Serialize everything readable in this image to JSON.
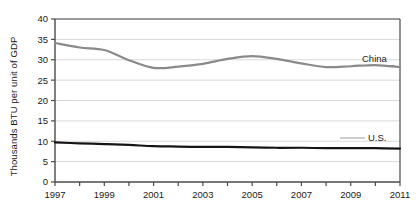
{
  "chart_data": {
    "type": "line",
    "title": "",
    "xlabel": "",
    "ylabel": "Thousands BTU per unit of GDP",
    "xlim": [
      1997,
      2011
    ],
    "ylim": [
      0,
      40
    ],
    "grid": true,
    "legend_position": "inline-right",
    "x": [
      1997,
      1998,
      1999,
      2000,
      2001,
      2002,
      2003,
      2004,
      2005,
      2006,
      2007,
      2008,
      2009,
      2010,
      2011
    ],
    "y_ticks": [
      0,
      5,
      10,
      15,
      20,
      25,
      30,
      35,
      40
    ],
    "y_tick_labels": [
      "0",
      "5",
      "10",
      "15",
      "20",
      "25",
      "30",
      "35",
      "40"
    ],
    "x_ticks": [
      1997,
      1998,
      1999,
      2000,
      2001,
      2002,
      2003,
      2004,
      2005,
      2006,
      2007,
      2008,
      2009,
      2010,
      2011
    ],
    "x_tick_labels": [
      "1997",
      "",
      "1999",
      "",
      "2001",
      "",
      "2003",
      "",
      "2005",
      "",
      "2007",
      "",
      "2009",
      "",
      "2011"
    ],
    "series": [
      {
        "name": "China",
        "color": "#8a8a8a",
        "width": 2.2,
        "label": "China",
        "values": [
          34.1,
          33.0,
          32.4,
          29.9,
          28.0,
          28.3,
          29.0,
          30.2,
          30.9,
          30.2,
          29.1,
          28.2,
          28.4,
          28.7,
          28.2
        ]
      },
      {
        "name": "U.S.",
        "color": "#141414",
        "width": 2.2,
        "label": "U.S.",
        "values": [
          9.7,
          9.5,
          9.3,
          9.1,
          8.8,
          8.7,
          8.6,
          8.6,
          8.5,
          8.4,
          8.4,
          8.3,
          8.3,
          8.3,
          8.2
        ]
      }
    ],
    "axis_color": "#4a4a4a",
    "grid_color": "#d8d8d8",
    "background": "#ffffff"
  }
}
